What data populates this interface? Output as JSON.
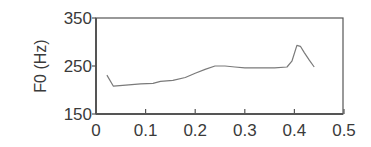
{
  "chart_data": {
    "type": "line",
    "title": "",
    "xlabel": "",
    "ylabel": "F0 (Hz)",
    "xlim": [
      0,
      0.5
    ],
    "ylim": [
      150,
      350
    ],
    "xticks": [
      0,
      0.1,
      0.2,
      0.3,
      0.4,
      0.5
    ],
    "xtick_labels": [
      "0",
      "0.1",
      "0.2",
      "0.3",
      "0.4",
      "0.5"
    ],
    "yticks": [
      150,
      250,
      350
    ],
    "ytick_labels": [
      "150",
      "250",
      "350"
    ],
    "grid": false,
    "legend": null,
    "series": [
      {
        "name": "F0",
        "color": "#7a7a7a",
        "x": [
          0.022,
          0.035,
          0.06,
          0.09,
          0.115,
          0.13,
          0.155,
          0.18,
          0.2,
          0.22,
          0.24,
          0.26,
          0.28,
          0.3,
          0.33,
          0.36,
          0.385,
          0.395,
          0.405,
          0.412,
          0.42,
          0.43,
          0.44
        ],
        "y": [
          231,
          208,
          210,
          213,
          214,
          218,
          220,
          226,
          235,
          243,
          250,
          250,
          248,
          246,
          246,
          246,
          248,
          260,
          293,
          291,
          278,
          262,
          248
        ]
      }
    ]
  },
  "colors": {
    "axis": "#555555",
    "line": "#7a7a7a",
    "text": "#3a3a3a",
    "background": "#ffffff"
  }
}
